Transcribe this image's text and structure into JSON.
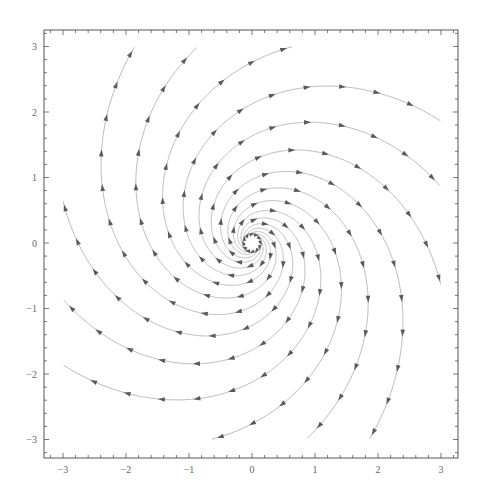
{
  "chart_data": {
    "type": "streamplot",
    "title": "",
    "xlabel": "",
    "ylabel": "",
    "xlim": [
      -3.28,
      3.28
    ],
    "ylim": [
      -3.28,
      3.28
    ],
    "grid": false,
    "legend": null,
    "x_ticks": [
      -3,
      -2,
      -1,
      0,
      1,
      2,
      3
    ],
    "y_ticks": [
      -3,
      -2,
      -1,
      0,
      1,
      2,
      3
    ],
    "x_tick_labels": [
      "-3",
      "-2",
      "-1",
      "0",
      "1",
      "2",
      "3"
    ],
    "y_tick_labels": [
      "-3",
      "-2",
      "-1",
      "0",
      "1",
      "2",
      "3"
    ],
    "minor_tick_step": 0.2,
    "field": {
      "description": "Linear spiral source, clockwise rotation, outward flow",
      "dx_dt": "0.5*x + y",
      "dy_dt": "-x + 0.5*y",
      "growth_k": 0.5,
      "rotation": "clockwise",
      "flow": "outward"
    },
    "streamlines": {
      "count": 12,
      "reference_crossing": {
        "x": -2.76,
        "y": 0
      },
      "boundary_endpoints": [
        {
          "x": -1.8,
          "y": 3
        },
        {
          "x": -1.0,
          "y": 3
        },
        {
          "x": 0.95,
          "y": 3
        },
        {
          "x": 3,
          "y": 1.8
        },
        {
          "x": 3,
          "y": 1.0
        },
        {
          "x": 3,
          "y": -1.0
        },
        {
          "x": 1.8,
          "y": -3
        },
        {
          "x": 1.0,
          "y": -3
        },
        {
          "x": -0.95,
          "y": -3
        },
        {
          "x": -3,
          "y": -1.8
        },
        {
          "x": -3,
          "y": -1.0
        },
        {
          "x": -3,
          "y": 1.0
        }
      ],
      "clip_box": [
        -3,
        3
      ],
      "inner_radius": 0.12
    },
    "colors": {
      "line": "#a8a8a8",
      "arrow": "#5a5a5a",
      "frame": "#555555",
      "tick_label": "#666666"
    }
  },
  "layout": {
    "plot_left": 44,
    "plot_right": 458,
    "plot_top": 30,
    "plot_bottom": 458,
    "origin_px": {
      "x": 252,
      "y": 243
    },
    "px_per_unit_x": 63.0,
    "px_per_unit_y": 65.5
  }
}
